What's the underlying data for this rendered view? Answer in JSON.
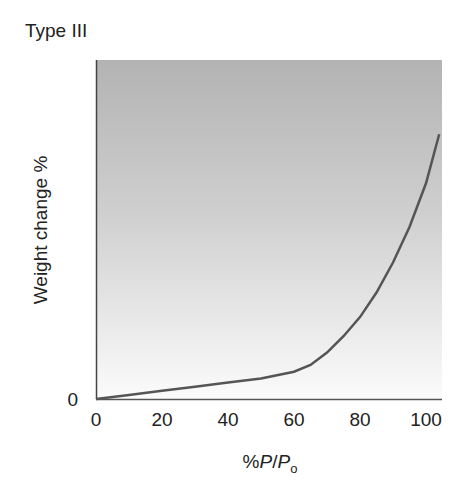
{
  "chart_data": {
    "type": "line",
    "title": "Type III",
    "xlabel": "%P/P₀",
    "ylabel": "Weight change %",
    "xlim": [
      0,
      105
    ],
    "ylim": [
      0,
      100
    ],
    "x_ticks": [
      "0",
      "20",
      "40",
      "60",
      "80",
      "100"
    ],
    "y_ticks": [
      "0"
    ],
    "grid": false,
    "series": [
      {
        "name": "Type III isotherm",
        "x": [
          0,
          10,
          20,
          30,
          40,
          50,
          60,
          65,
          70,
          75,
          80,
          85,
          90,
          95,
          100,
          104
        ],
        "y": [
          0,
          1.5,
          3,
          4.5,
          6,
          7.5,
          10,
          12.5,
          17,
          23,
          30,
          39,
          50,
          63,
          79,
          97
        ]
      }
    ],
    "background": "gradient grey (dark top) to white (bottom)"
  },
  "labels": {
    "title": "Type III",
    "ylabel": "Weight change %",
    "y_zero": "0",
    "x_prefix": "%",
    "x_P": "P",
    "x_slash": "/",
    "x_P2": "P",
    "x_sub": "o"
  }
}
